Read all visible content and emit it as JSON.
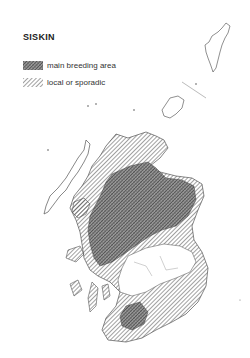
{
  "map": {
    "title": "SISKIN",
    "region": "Scotland",
    "legend": [
      {
        "label": "main breeding area",
        "pattern": "dense-crosshatch"
      },
      {
        "label": "local or sporadic",
        "pattern": "diagonal-hatch"
      }
    ],
    "colors": {
      "ink": "#333333",
      "background": "#ffffff"
    }
  }
}
